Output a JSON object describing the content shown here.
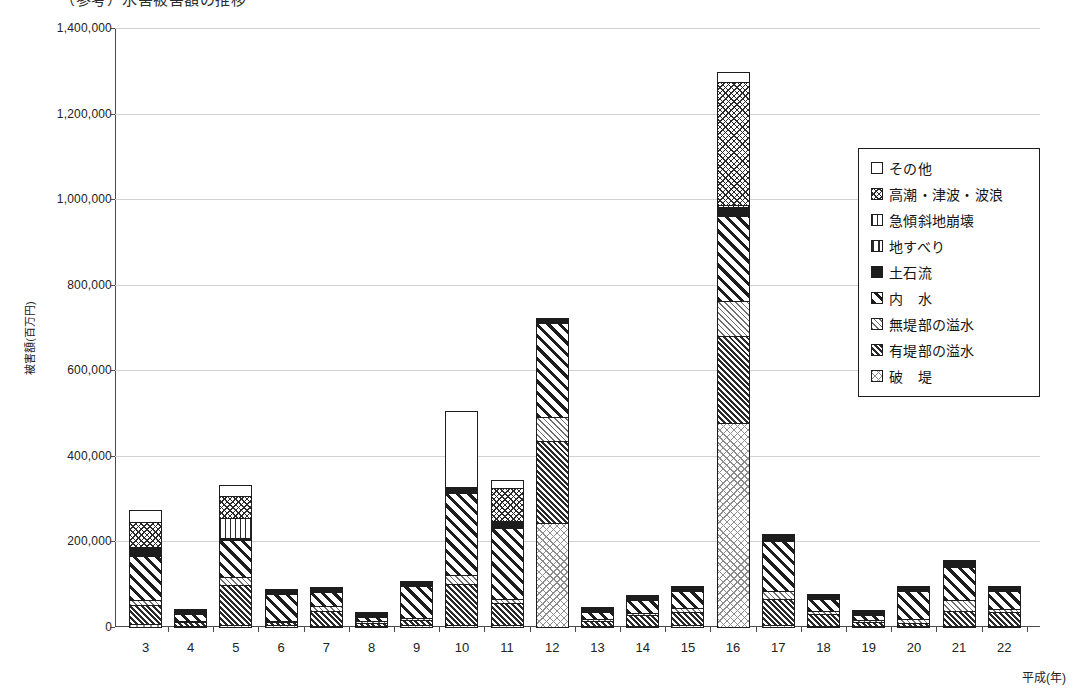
{
  "top_clipped_text": "（参考）水害被害額の推移",
  "axes": {
    "y_title": "被害額(百万円)",
    "x_title": "平成(年)",
    "y_ticks": [
      0,
      200000,
      400000,
      600000,
      800000,
      1000000,
      1200000,
      1400000
    ],
    "y_tick_labels": [
      "0",
      "200,000",
      "400,000",
      "600,000",
      "800,000",
      "1,000,000",
      "1,200,000",
      "1,400,000"
    ]
  },
  "legend": {
    "items": [
      {
        "label": "その他",
        "pattern": "p-other",
        "key": "other"
      },
      {
        "label": "高潮・津波・波浪",
        "pattern": "p-storm",
        "key": "storm_surge"
      },
      {
        "label": "急傾斜地崩壊",
        "pattern": "p-steep",
        "key": "steep_slope"
      },
      {
        "label": "地すべり",
        "pattern": "p-land",
        "key": "landslide"
      },
      {
        "label": "土石流",
        "pattern": "p-debris",
        "key": "debris_flow"
      },
      {
        "label": "内　水",
        "pattern": "p-inner",
        "key": "inland_water"
      },
      {
        "label": "無堤部の溢水",
        "pattern": "p-nolevee",
        "key": "overflow_no_levee"
      },
      {
        "label": "有堤部の溢水",
        "pattern": "p-levee",
        "key": "overflow_levee"
      },
      {
        "label": "破　堤",
        "pattern": "p-breach",
        "key": "levee_breach"
      }
    ]
  },
  "chart_data": {
    "type": "bar",
    "stacked": true,
    "title": "",
    "xlabel": "平成(年)",
    "ylabel": "被害額(百万円)",
    "ylim": [
      0,
      1400000
    ],
    "grid": true,
    "legend_position": "right-inside",
    "categories": [
      "3",
      "4",
      "5",
      "6",
      "7",
      "8",
      "9",
      "10",
      "11",
      "12",
      "13",
      "14",
      "15",
      "16",
      "17",
      "18",
      "19",
      "20",
      "21",
      "22"
    ],
    "series": [
      {
        "name": "破堤",
        "key": "levee_breach",
        "values": [
          10000,
          2000,
          8000,
          6000,
          4000,
          5000,
          6000,
          8000,
          6000,
          245000,
          3000,
          4000,
          6000,
          480000,
          8000,
          4000,
          2000,
          3000,
          4000,
          3000
        ]
      },
      {
        "name": "有堤部の溢水",
        "key": "overflow_levee",
        "values": [
          45000,
          12000,
          95000,
          10000,
          38000,
          10000,
          14000,
          98000,
          55000,
          195000,
          14000,
          28000,
          34000,
          205000,
          62000,
          30000,
          12000,
          10000,
          38000,
          35000
        ]
      },
      {
        "name": "無堤部の溢水",
        "key": "overflow_no_levee",
        "values": [
          15000,
          3000,
          20000,
          6000,
          14000,
          6000,
          8000,
          22000,
          12000,
          58000,
          6000,
          8000,
          12000,
          85000,
          22000,
          10000,
          6000,
          10000,
          28000,
          10000
        ]
      },
      {
        "name": "内　水",
        "key": "inland_water",
        "values": [
          105000,
          18000,
          90000,
          64000,
          35000,
          12000,
          78000,
          195000,
          168000,
          222000,
          20000,
          33000,
          42000,
          200000,
          118000,
          30000,
          14000,
          68000,
          80000,
          45000
        ]
      },
      {
        "name": "土石流",
        "key": "debris_flow",
        "values": [
          18000,
          2000,
          4000,
          2000,
          2000,
          1000,
          2000,
          10000,
          14000,
          3000,
          1000,
          1000,
          2000,
          22000,
          9000,
          4000,
          1000,
          2000,
          8000,
          4000
        ]
      },
      {
        "name": "地すべり",
        "key": "landslide",
        "values": [
          2000,
          1000,
          2000,
          1000,
          1000,
          500,
          1000,
          2000,
          2000,
          1000,
          500,
          500,
          1000,
          4000,
          2000,
          1000,
          500,
          1000,
          1000,
          1000
        ]
      },
      {
        "name": "急傾斜地崩壊",
        "key": "steep_slope",
        "values": [
          3000,
          1000,
          48000,
          1000,
          2000,
          1000,
          1000,
          3000,
          4000,
          2000,
          1000,
          1000,
          2000,
          6000,
          3000,
          2000,
          1000,
          1000,
          2000,
          2000
        ]
      },
      {
        "name": "高潮・津波・波浪",
        "key": "storm_surge",
        "values": [
          62000,
          1000,
          55000,
          1000,
          2000,
          1000,
          1000,
          2000,
          80000,
          2000,
          1000,
          1000,
          1000,
          290000,
          1000,
          1000,
          1000,
          1000,
          1000,
          1000
        ]
      },
      {
        "name": "その他",
        "key": "other",
        "values": [
          30000,
          1000,
          28000,
          1000,
          2000,
          1000,
          1000,
          180000,
          20000,
          3000,
          1000,
          1000,
          1000,
          25000,
          3000,
          1000,
          1000,
          1000,
          1000,
          1000
        ]
      }
    ],
    "totals": [
      290000,
      41000,
      350000,
      92000,
      100000,
      37500,
      112000,
      520000,
      361000,
      731000,
      47500,
      77500,
      101000,
      1317000,
      228000,
      83000,
      38500,
      97000,
      163000,
      102000
    ]
  }
}
